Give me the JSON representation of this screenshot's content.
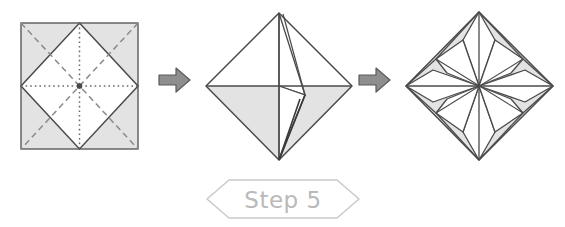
{
  "page": {
    "background_color": "#ffffff",
    "width": 565,
    "height": 227
  },
  "palette": {
    "paper_shaded": "#e3e3e3",
    "paper_white": "#ffffff",
    "line_dark": "#4a4a4a",
    "line_mid": "#6e6e6e",
    "crease_dashed": "#8a8a8a",
    "crease_dotted": "#6a6a6a",
    "arrow_fill": "#8e8e8e",
    "arrow_stroke": "#5a5a5a",
    "banner_stroke": "#c9c9c9",
    "banner_text": "#b9b9b9"
  },
  "steps": [
    {
      "id": "panel-1",
      "name": "square-with-crease-pattern",
      "caption": "Square sheet with diagonal valley creases and inscribed diamond",
      "shape": "square",
      "fill": "shaded",
      "creases": {
        "dashed_diagonals": 4,
        "dotted_axes": 2,
        "solid_diamond_edges": 4
      }
    },
    {
      "id": "panel-2",
      "name": "diamond-with-open-flap",
      "caption": "Diamond with upper half white and lower half shaded, one flap lifted",
      "shape": "diamond",
      "flaps": 1
    },
    {
      "id": "panel-3",
      "name": "eight-point-star",
      "caption": "Completed eight-pointed star inside diamond",
      "shape": "diamond",
      "star_points": 8
    }
  ],
  "arrows": [
    {
      "name": "arrow-step-1-to-2",
      "direction": "right",
      "glyph": "block-arrow-right"
    },
    {
      "name": "arrow-step-2-to-3",
      "direction": "right",
      "glyph": "block-arrow-right"
    }
  ],
  "banner": {
    "label": "Step 5",
    "shape": "hexagon"
  }
}
